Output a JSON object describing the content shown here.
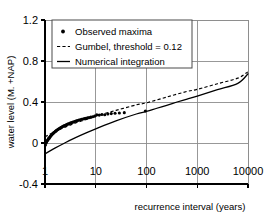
{
  "chart_data": {
    "type": "line",
    "title": "",
    "xlabel": "recurrence interval (years)",
    "ylabel": "water level (M. +NAP)",
    "xscale": "log",
    "xlim": [
      1,
      10000
    ],
    "ylim": [
      -0.4,
      1.2
    ],
    "grid": true,
    "legend_position": "top-left-inside",
    "xticks": [
      1,
      10,
      100,
      1000,
      10000
    ],
    "xtick_labels": [
      "1",
      "10",
      "100",
      "1000",
      "10000"
    ],
    "yticks": [
      -0.4,
      0,
      0.4,
      0.8,
      1.2
    ],
    "ytick_labels": [
      "-0.4",
      "0",
      "0.4",
      "0.8",
      "1.2"
    ],
    "legend": [
      {
        "label": "Observed maxima",
        "marker": "dot",
        "style": "none"
      },
      {
        "label": "Gumbel, threshold = 0.12",
        "marker": "none",
        "style": "dotted"
      },
      {
        "label": "Numerical integration",
        "marker": "none",
        "style": "solid"
      }
    ],
    "series": [
      {
        "name": "Observed maxima",
        "type": "scatter",
        "marker": "dot",
        "x": [
          1.02,
          1.05,
          1.07,
          1.09,
          1.11,
          1.14,
          1.16,
          1.19,
          1.22,
          1.25,
          1.28,
          1.31,
          1.35,
          1.38,
          1.42,
          1.46,
          1.5,
          1.55,
          1.6,
          1.65,
          1.7,
          1.76,
          1.82,
          1.88,
          1.95,
          2.02,
          2.1,
          2.18,
          2.27,
          2.36,
          2.46,
          2.57,
          2.68,
          2.8,
          2.93,
          3.07,
          3.22,
          3.38,
          3.55,
          3.74,
          3.94,
          4.16,
          4.4,
          4.66,
          4.94,
          5.25,
          5.6,
          5.98,
          6.4,
          6.88,
          7.4,
          8.0,
          8.7,
          9.5,
          10.5,
          11.7,
          13.2,
          15.0,
          17.3,
          20.2,
          24.0,
          29.2,
          36.5,
          95.0
        ],
        "y": [
          -0.02,
          0.0,
          0.01,
          0.02,
          0.025,
          0.03,
          0.04,
          0.045,
          0.05,
          0.058,
          0.065,
          0.072,
          0.078,
          0.085,
          0.09,
          0.096,
          0.102,
          0.108,
          0.113,
          0.118,
          0.124,
          0.129,
          0.134,
          0.139,
          0.144,
          0.149,
          0.154,
          0.158,
          0.163,
          0.167,
          0.171,
          0.176,
          0.18,
          0.184,
          0.188,
          0.192,
          0.196,
          0.2,
          0.204,
          0.208,
          0.212,
          0.216,
          0.22,
          0.224,
          0.227,
          0.231,
          0.234,
          0.238,
          0.241,
          0.245,
          0.248,
          0.252,
          0.256,
          0.262,
          0.275,
          0.272,
          0.278,
          0.276,
          0.283,
          0.287,
          0.29,
          0.293,
          0.296,
          0.312
        ]
      },
      {
        "name": "Gumbel, threshold = 0.12",
        "type": "line",
        "style": "dotted",
        "x": [
          1,
          1.6,
          2.5,
          4,
          6.3,
          10,
          25,
          63,
          100,
          250,
          630,
          1000,
          2500,
          6300,
          10000
        ],
        "y": [
          0.06,
          0.113,
          0.155,
          0.195,
          0.228,
          0.262,
          0.318,
          0.372,
          0.392,
          0.448,
          0.503,
          0.523,
          0.578,
          0.633,
          0.695
        ]
      },
      {
        "name": "Numerical integration",
        "type": "line",
        "style": "solid",
        "x": [
          1,
          1.6,
          2.5,
          4,
          6.3,
          10,
          25,
          63,
          100,
          160,
          250,
          400,
          630,
          1000,
          2500,
          6300,
          10000
        ],
        "y": [
          -0.105,
          -0.048,
          0.003,
          0.052,
          0.096,
          0.138,
          0.216,
          0.283,
          0.308,
          0.339,
          0.368,
          0.4,
          0.429,
          0.458,
          0.52,
          0.582,
          0.675
        ]
      }
    ]
  }
}
